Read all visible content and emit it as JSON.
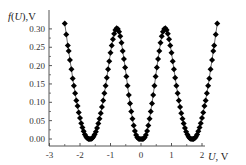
{
  "chart_data": {
    "type": "line",
    "title": "",
    "xlabel": "U, V",
    "ylabel": "f(U),V",
    "xlim": [
      -3,
      2.9
    ],
    "ylim": [
      -0.01,
      0.34
    ],
    "grid": false,
    "legend": null,
    "x_ticks": [
      "-3",
      "-2",
      "-1",
      "0",
      "1",
      "2"
    ],
    "y_ticks": [
      "0.00",
      "0.05",
      "0.10",
      "0.15",
      "0.20",
      "0.25",
      "0.30"
    ],
    "marker": "diamond",
    "series": [
      {
        "name": "f(U)",
        "x": [
          -2.5,
          -2.45,
          -2.4,
          -2.37,
          -2.33,
          -2.28,
          -2.24,
          -2.2,
          -2.16,
          -2.12,
          -2.08,
          -2.04,
          -2.0,
          -1.96,
          -1.92,
          -1.88,
          -1.84,
          -1.8,
          -1.76,
          -1.72,
          -1.68,
          -1.64,
          -1.6,
          -1.56,
          -1.52,
          -1.48,
          -1.44,
          -1.4,
          -1.36,
          -1.32,
          -1.28,
          -1.24,
          -1.2,
          -1.16,
          -1.12,
          -1.08,
          -1.04,
          -1.0,
          -0.96,
          -0.92,
          -0.88,
          -0.84,
          -0.8,
          -0.76,
          -0.72,
          -0.68,
          -0.64,
          -0.6,
          -0.56,
          -0.52,
          -0.48,
          -0.44,
          -0.4,
          -0.36,
          -0.32,
          -0.28,
          -0.24,
          -0.2,
          -0.16,
          -0.12,
          -0.08,
          -0.04,
          0.0,
          0.04,
          0.08,
          0.12,
          0.16,
          0.2,
          0.24,
          0.28,
          0.32,
          0.36,
          0.4,
          0.44,
          0.48,
          0.52,
          0.56,
          0.6,
          0.64,
          0.68,
          0.72,
          0.76,
          0.8,
          0.84,
          0.88,
          0.92,
          0.96,
          1.0,
          1.04,
          1.08,
          1.12,
          1.16,
          1.2,
          1.24,
          1.28,
          1.32,
          1.36,
          1.4,
          1.44,
          1.48,
          1.52,
          1.56,
          1.6,
          1.64,
          1.68,
          1.72,
          1.76,
          1.8,
          1.84,
          1.88,
          1.92,
          1.96,
          2.0,
          2.04,
          2.08,
          2.12,
          2.16,
          2.2,
          2.24,
          2.28,
          2.33,
          2.37,
          2.4,
          2.45,
          2.5
        ],
        "values": [
          0.315,
          0.285,
          0.255,
          0.24,
          0.215,
          0.19,
          0.165,
          0.145,
          0.125,
          0.105,
          0.09,
          0.072,
          0.057,
          0.043,
          0.031,
          0.021,
          0.012,
          0.006,
          0.002,
          0.0,
          0.0,
          0.0,
          0.002,
          0.006,
          0.012,
          0.02,
          0.03,
          0.042,
          0.055,
          0.07,
          0.087,
          0.105,
          0.125,
          0.145,
          0.167,
          0.19,
          0.212,
          0.235,
          0.255,
          0.272,
          0.287,
          0.297,
          0.302,
          0.3,
          0.292,
          0.28,
          0.262,
          0.24,
          0.218,
          0.195,
          0.17,
          0.145,
          0.12,
          0.097,
          0.075,
          0.055,
          0.037,
          0.022,
          0.011,
          0.004,
          0.001,
          0.0,
          0.0,
          0.0,
          0.001,
          0.004,
          0.011,
          0.022,
          0.037,
          0.055,
          0.075,
          0.097,
          0.12,
          0.145,
          0.17,
          0.195,
          0.218,
          0.24,
          0.262,
          0.28,
          0.292,
          0.3,
          0.302,
          0.297,
          0.287,
          0.272,
          0.255,
          0.235,
          0.212,
          0.19,
          0.167,
          0.145,
          0.125,
          0.105,
          0.087,
          0.07,
          0.055,
          0.042,
          0.03,
          0.02,
          0.012,
          0.006,
          0.002,
          0.0,
          0.0,
          0.0,
          0.002,
          0.006,
          0.012,
          0.021,
          0.031,
          0.043,
          0.057,
          0.072,
          0.09,
          0.105,
          0.125,
          0.145,
          0.165,
          0.19,
          0.215,
          0.24,
          0.255,
          0.285,
          0.315
        ]
      }
    ]
  }
}
